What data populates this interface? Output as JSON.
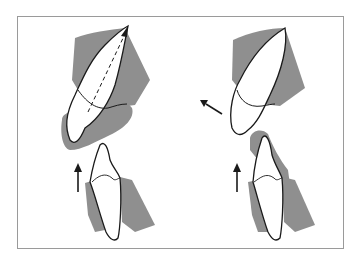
{
  "figure": {
    "panels": [
      {
        "id": "left",
        "upper_tooth_axis": "dashed long axis with arrow toward apex",
        "lower_arrow": "upward"
      },
      {
        "id": "right",
        "upper_tooth_arrow": "labial/outward (up-left)",
        "lower_arrow": "upward"
      }
    ],
    "colors": {
      "tissue": "#8c8c8c",
      "outline": "#1a1a1a",
      "frame": "#9a9a9a",
      "tooth": "#ffffff"
    }
  }
}
